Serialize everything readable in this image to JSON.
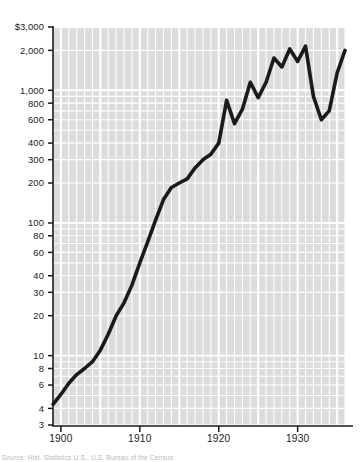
{
  "chart_data": {
    "type": "line",
    "title": "",
    "subtitle": "",
    "xlabel": "",
    "ylabel": "",
    "yscale": "log",
    "xscale": "linear",
    "grid": true,
    "legend": null,
    "xlim": [
      1899,
      1936
    ],
    "ylim": [
      3,
      3000
    ],
    "ytick_labels": [
      "$3,000",
      "2,000",
      "1,000",
      "800",
      "600",
      "400",
      "300",
      "200",
      "100",
      "80",
      "60",
      "40",
      "30",
      "20",
      "10",
      "8",
      "6",
      "4",
      "3"
    ],
    "ytick_values": [
      3000,
      2000,
      1000,
      800,
      600,
      400,
      300,
      200,
      100,
      80,
      60,
      40,
      30,
      20,
      10,
      8,
      6,
      4,
      3
    ],
    "xtick_labels": [
      "1900",
      "1910",
      "1920",
      "1930"
    ],
    "xtick_values": [
      1900,
      1910,
      1920,
      1930
    ],
    "series": [
      {
        "name": "value",
        "x": [
          1899,
          1900,
          1901,
          1902,
          1903,
          1904,
          1905,
          1906,
          1907,
          1908,
          1909,
          1910,
          1911,
          1912,
          1913,
          1914,
          1915,
          1916,
          1917,
          1918,
          1919,
          1920,
          1921,
          1922,
          1923,
          1924,
          1925,
          1926,
          1927,
          1928,
          1929,
          1930,
          1931,
          1932,
          1933,
          1934,
          1935,
          1936
        ],
        "y": [
          4.3,
          5.1,
          6.2,
          7.2,
          8.0,
          9.0,
          11.0,
          14.5,
          20.0,
          25.0,
          34.0,
          50.0,
          72.0,
          105.0,
          150.0,
          185.0,
          200.0,
          215.0,
          260.0,
          300.0,
          330.0,
          400.0,
          840.0,
          560.0,
          720.0,
          1150.0,
          880.0,
          1150.0,
          1750.0,
          1500.0,
          2050.0,
          1650.0,
          2150.0,
          900.0,
          600.0,
          700.0,
          1350.0,
          2000.0
        ]
      }
    ],
    "plot_area_px": {
      "left": 53,
      "top": 27,
      "right": 345,
      "bottom": 425
    },
    "colors": {
      "plot_background": "#dcdcdc",
      "gridline": "#ffffff",
      "line": "#1a1a1a",
      "axis": "#1a1a1a",
      "page_background": "#ffffff",
      "caption": "#b9b9b9"
    }
  },
  "caption": {
    "text": "Source: Hist. Statistics U.S., U.S. Bureau of the Census"
  }
}
